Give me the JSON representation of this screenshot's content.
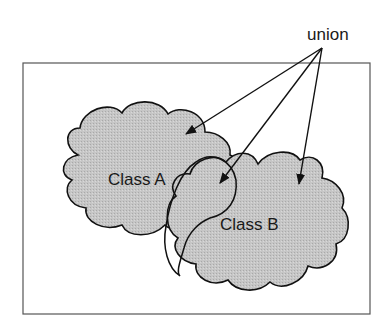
{
  "diagram": {
    "annotation": "union",
    "classes": [
      {
        "label": "Class A"
      },
      {
        "label": "Class B"
      }
    ],
    "colors": {
      "background": "#ffffff",
      "frame": "#555555",
      "cloud_fill": "#c4c4c4",
      "stroke": "#111111"
    },
    "arrows": [
      {
        "from": "union",
        "to": "Class A region"
      },
      {
        "from": "union",
        "to": "Class A ∩ Class B overlap"
      },
      {
        "from": "union",
        "to": "Class B region"
      }
    ]
  }
}
